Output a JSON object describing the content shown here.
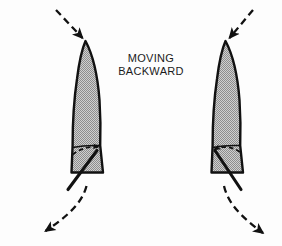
{
  "figure": {
    "title": "MOVING BACKWARD",
    "caption_lines": [
      "MOVING",
      "BACKWARD"
    ],
    "view": "overhead",
    "background_color": "#fdfdfd",
    "hull_fill_color": "#a8a8a8",
    "hull_outline_color": "#111111",
    "arrow_color": "#111111",
    "text_color": "#1b1b1b"
  },
  "boats": [
    {
      "id": "left-boat",
      "label": "left-boat",
      "tiller_direction": "to-port-lower-left",
      "rudder_arrow_direction": "right",
      "approach_arrow_direction": "down-right",
      "wake_arrow_direction": "down-left"
    },
    {
      "id": "right-boat",
      "label": "right-boat",
      "tiller_direction": "to-starboard-lower-right",
      "rudder_arrow_direction": "left",
      "approach_arrow_direction": "down-left",
      "wake_arrow_direction": "down-right"
    }
  ],
  "annotations": {
    "approach_arrow_name": "dashed-approach-arrow",
    "wake_arrow_name": "dashed-wake-arrow",
    "rudder_swing_arrow_name": "dashed-rudder-swing-arrow",
    "tiller_name": "tiller-bar"
  }
}
